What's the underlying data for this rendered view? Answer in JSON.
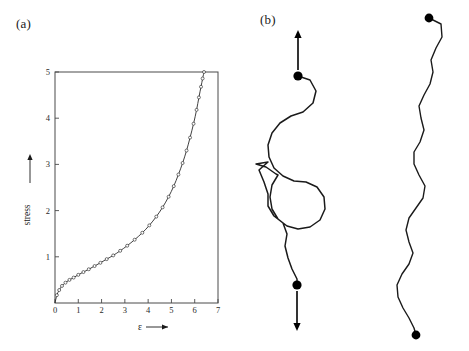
{
  "figure": {
    "panel_a_label": "(a)",
    "panel_b_label": "(b)"
  },
  "chart_data": {
    "type": "line",
    "title": "",
    "xlabel": "ε",
    "ylabel": "stress",
    "xlim": [
      0,
      7
    ],
    "ylim": [
      0,
      5
    ],
    "xticks": [
      0,
      1,
      2,
      3,
      4,
      5,
      6,
      7
    ],
    "xticklabels": [
      "0",
      "1",
      "2",
      "3",
      "4",
      "5",
      "6",
      "7"
    ],
    "yticks": [
      1,
      2,
      3,
      4,
      5
    ],
    "yticklabels": [
      "1",
      "2",
      "3",
      "4",
      "5"
    ],
    "grid": false,
    "legend": null,
    "marker": "open-circle",
    "series": [
      {
        "name": "stress-strain",
        "x": [
          0.0,
          0.08,
          0.18,
          0.3,
          0.45,
          0.62,
          0.8,
          1.0,
          1.22,
          1.45,
          1.7,
          1.95,
          2.22,
          2.5,
          2.8,
          3.1,
          3.42,
          3.75,
          4.05,
          4.35,
          4.62,
          4.88,
          5.1,
          5.3,
          5.48,
          5.65,
          5.8,
          5.95,
          6.08,
          6.18,
          6.27,
          6.34,
          6.4
        ],
        "y": [
          0.0,
          0.17,
          0.28,
          0.37,
          0.44,
          0.5,
          0.55,
          0.61,
          0.67,
          0.73,
          0.8,
          0.87,
          0.95,
          1.03,
          1.13,
          1.24,
          1.37,
          1.52,
          1.68,
          1.87,
          2.07,
          2.3,
          2.53,
          2.78,
          3.03,
          3.3,
          3.58,
          3.88,
          4.18,
          4.45,
          4.68,
          4.86,
          5.0
        ]
      }
    ]
  },
  "chains": {
    "coiled": {
      "name": "coiled-polymer-chain",
      "top_arrow_label": "tension-up",
      "bottom_arrow_label": "tension-down",
      "endpoint_top": [
        298,
        76
      ],
      "endpoint_bottom": [
        297,
        285
      ],
      "path": "M 298 76 L 310 80 L 316 91 L 313 103 L 303 112 L 291 116 L 280 123 L 272 133 L 268 145 L 269 157 L 274 168 L 283 176 L 294 181 L 306 182 L 317 187 L 324 197 L 325 209 L 320 220 L 310 227 L 298 229 L 287 226 L 278 219 L 272 209 L 270 197 L 272 185 L 278 175 L 276 174 L 266 167 L 256 164 L 268 162 L 259 170 L 264 182 L 268 194 L 268 206 L 274 216 L 283 223 L 287 234 L 285 246 L 288 258 L 292 269 L 297 279 L 297 285",
      "arrow_top": {
        "x": 298,
        "y1": 70,
        "y2": 30
      },
      "arrow_bottom": {
        "x": 297,
        "y1": 291,
        "y2": 331
      }
    },
    "extended": {
      "name": "extended-polymer-chain",
      "endpoint_top": [
        429,
        18
      ],
      "endpoint_bottom": [
        416,
        335
      ],
      "path": "M 429 18 L 441 24 L 442 37 L 436 48 L 431 60 L 433 72 L 430 84 L 424 95 L 419 106 L 421 118 L 424 130 L 420 142 L 414 152 L 414 164 L 419 175 L 425 186 L 423 198 L 416 208 L 409 218 L 406 230 L 409 242 L 413 253 L 409 264 L 402 274 L 397 285 L 398 297 L 403 308 L 409 318 L 414 328 L 416 335"
    }
  }
}
